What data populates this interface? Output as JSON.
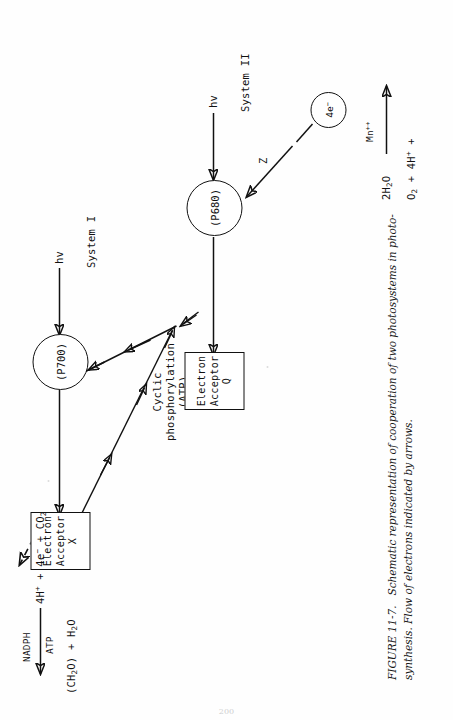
{
  "figure": {
    "number": "FIGURE 11-7.",
    "caption_line1": "Schematic representation of cooperation of two photosystems in photo-",
    "caption_line2": "synthesis. Flow of electrons indicated by arrows.",
    "page_folio": "200"
  },
  "diagram": {
    "acceptor_x": {
      "line1": "Electron",
      "line2": "Acceptor X"
    },
    "acceptor_q": {
      "line1": "Electron",
      "line2": "Acceptor Q"
    },
    "reaction_center_1": "(P700)",
    "reaction_center_2": "(P680)",
    "system_1_label": "System I",
    "system_2_label": "System II",
    "photon_1": "hv",
    "photon_2": "hv",
    "z_carrier": "Z",
    "cyclic_label_line1": "Cyclic",
    "cyclic_label_line2": "phosphorylation",
    "cyclic_label_line3": "(ATP)"
  },
  "carbon_fixation": {
    "reactants": "4H+ + 4e- + CO2",
    "arrow_above": "NADPH",
    "arrow_below": "ATP",
    "products": "(CH2O) + H2O"
  },
  "water_splitting": {
    "reactant": "2H2O",
    "catalyst": "Mn++",
    "products": "O2 + 4H+ +",
    "electrons": "4e-"
  },
  "colors": {
    "ink": "#111111",
    "paper": "#fefefe",
    "caption_ink": "#1a1a1a"
  }
}
